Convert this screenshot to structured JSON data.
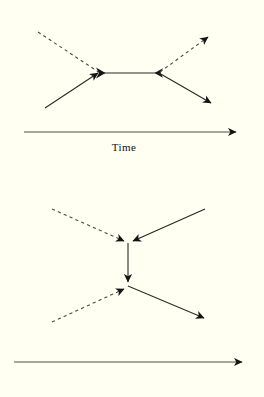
{
  "figure": {
    "background_color": "#fffff2",
    "line_color": "#1a1a1a",
    "axis_color": "#3a3a30",
    "diagrams": [
      {
        "id": "top-diagram",
        "name": "s-channel-feynman-diagram",
        "axis_label": "Time",
        "vertices": [
          {
            "name": "left-vertex",
            "x": 100,
            "y": 73
          },
          {
            "name": "right-vertex",
            "x": 159,
            "y": 73
          }
        ],
        "lines": [
          {
            "name": "incoming-dashed-upper-left",
            "style": "dashed",
            "from": [
              38,
              32
            ],
            "to": [
              100,
              73
            ],
            "arrow": "none"
          },
          {
            "name": "incoming-solid-lower-left",
            "style": "solid",
            "from": [
              45,
              108
            ],
            "to": [
              100,
              73
            ],
            "arrow": "end"
          },
          {
            "name": "internal-propagator",
            "style": "solid",
            "from": [
              100,
              73
            ],
            "to": [
              159,
              73
            ],
            "arrow": "both-inward"
          },
          {
            "name": "outgoing-dashed-upper-right",
            "style": "dashed",
            "from": [
              159,
              73
            ],
            "to": [
              213,
              33
            ],
            "arrow": "end"
          },
          {
            "name": "outgoing-solid-lower-right",
            "style": "solid",
            "from": [
              159,
              73
            ],
            "to": [
              215,
              106
            ],
            "arrow": "end"
          }
        ],
        "axis": {
          "name": "time-axis",
          "from": [
            24,
            132
          ],
          "to": [
            242,
            132
          ],
          "arrow": "end"
        }
      },
      {
        "id": "bottom-diagram",
        "name": "t-channel-feynman-diagram",
        "axis_label": "Time",
        "vertices": [
          {
            "name": "upper-vertex",
            "x": 128,
            "y": 243
          },
          {
            "name": "lower-vertex",
            "x": 128,
            "y": 286
          }
        ],
        "lines": [
          {
            "name": "incoming-dashed-upper-left",
            "style": "dashed",
            "from": [
              52,
              209
            ],
            "to": [
              128,
              243
            ],
            "arrow": "end"
          },
          {
            "name": "incoming-solid-upper-right",
            "style": "solid",
            "from": [
              205,
              209
            ],
            "to": [
              128,
              243
            ],
            "arrow": "end"
          },
          {
            "name": "internal-propagator-vertical",
            "style": "solid",
            "from": [
              128,
              243
            ],
            "to": [
              128,
              286
            ],
            "arrow": "end"
          },
          {
            "name": "outgoing-dashed-lower-left",
            "style": "dashed",
            "from": [
              52,
              322
            ],
            "to": [
              128,
              286
            ],
            "arrow": "end"
          },
          {
            "name": "outgoing-solid-lower-right",
            "style": "solid",
            "from": [
              128,
              286
            ],
            "to": [
              208,
              320
            ],
            "arrow": "end"
          }
        ],
        "axis": {
          "name": "time-axis",
          "from": [
            14,
            362
          ],
          "to": [
            248,
            362
          ],
          "arrow": "end"
        }
      }
    ]
  }
}
